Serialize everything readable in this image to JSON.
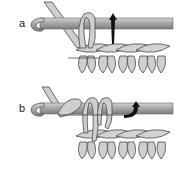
{
  "figure": {
    "type": "crochet-technique-illustration",
    "panels": [
      {
        "label": "a",
        "description": "Hook inserted with yarn wrapped; arrow indicates pulling loop up through stitch"
      },
      {
        "label": "b",
        "description": "Yarn over and loops on hook; arrow indicates drawing through loops"
      }
    ]
  },
  "colors": {
    "hook": "#9a9a9a",
    "hook_highlight": "#c8c8c8",
    "yarn_fill": "#d0d0d0",
    "outline": "#4a4a4a",
    "arrow": "#111111",
    "background": "#ffffff"
  }
}
